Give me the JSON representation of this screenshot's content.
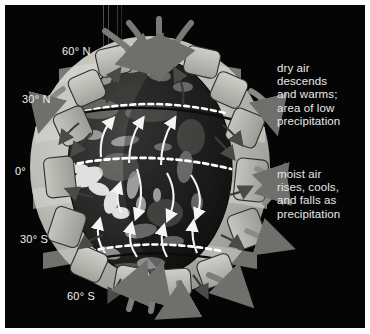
{
  "figure": {
    "background_color": "#050505",
    "border_color": "#ffffff"
  },
  "callouts": [
    {
      "id": "dry-air",
      "text": "dry air\ndescends\nand warms;\narea of low\nprecipitation",
      "color": "#e8e8e8",
      "position": "upper-right"
    },
    {
      "id": "moist-air",
      "text": "moist air\nrises, cools,\nand falls as\nprecipitation",
      "color": "#e8e8e8",
      "position": "middle-right"
    }
  ],
  "latitude_labels": [
    {
      "id": "lat-60n",
      "text": "60° N"
    },
    {
      "id": "lat-30n",
      "text": "30° N"
    },
    {
      "id": "lat-0",
      "text": "0°"
    },
    {
      "id": "lat-30s",
      "text": "30° S"
    },
    {
      "id": "lat-60s",
      "text": "60° S"
    }
  ],
  "globe": {
    "surface": "satellite cloud imagery of Earth, grayscale",
    "dashed_latitude_lines": 3,
    "surface_wind_arrows": 11,
    "circulation_cell_blocks": 22,
    "cell_color": "#b9b9b4",
    "arrow_color": "#6e6e6e",
    "wind_arrow_color": "#f2f2f2"
  }
}
